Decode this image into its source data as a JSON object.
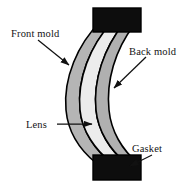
{
  "figure": {
    "background_color": "#ffffff",
    "width": 195,
    "height": 188
  },
  "labels": {
    "front_mold": "Front mold",
    "back_mold": "Back mold",
    "lens": "Lens",
    "gasket": "Gasket"
  },
  "parts": {
    "front_mold": {
      "name": "Front mold",
      "fill_color": "#b5b5b5",
      "stroke_color": "#000000"
    },
    "lens": {
      "name": "Lens",
      "fill_color": "#ececec",
      "stroke_color": "#000000"
    },
    "back_mold": {
      "name": "Back mold",
      "fill_color": "#b0b0b0",
      "stroke_color": "#000000"
    },
    "gasket_top": {
      "name": "Gasket",
      "fill_color": "#0d0d0d",
      "stroke_color": "#000000"
    },
    "gasket_bottom": {
      "name": "Gasket",
      "fill_color": "#0d0d0d",
      "stroke_color": "#000000"
    }
  },
  "leader_lines": {
    "front_mold": {
      "from": "label right edge",
      "to": "front mold outer surface"
    },
    "back_mold": {
      "from": "label lower left",
      "to": "back mold outer surface"
    },
    "lens": {
      "from": "label right edge",
      "to": "lens body"
    },
    "gasket": {
      "from": "label lower left",
      "to": "bottom gasket block"
    }
  }
}
